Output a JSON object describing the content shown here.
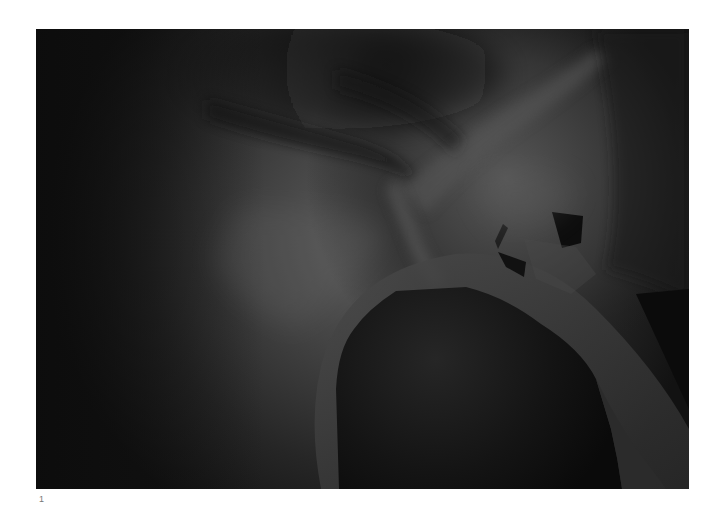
{
  "figure": {
    "panel_label": "1",
    "colors": {
      "background": "#ffffff",
      "darkest": "#0a0a0a",
      "wall_dark": "#1c1c1c",
      "wall_mid": "#3a3a3a",
      "wall_light": "#585858",
      "highlight": "#6a6a6a"
    }
  }
}
